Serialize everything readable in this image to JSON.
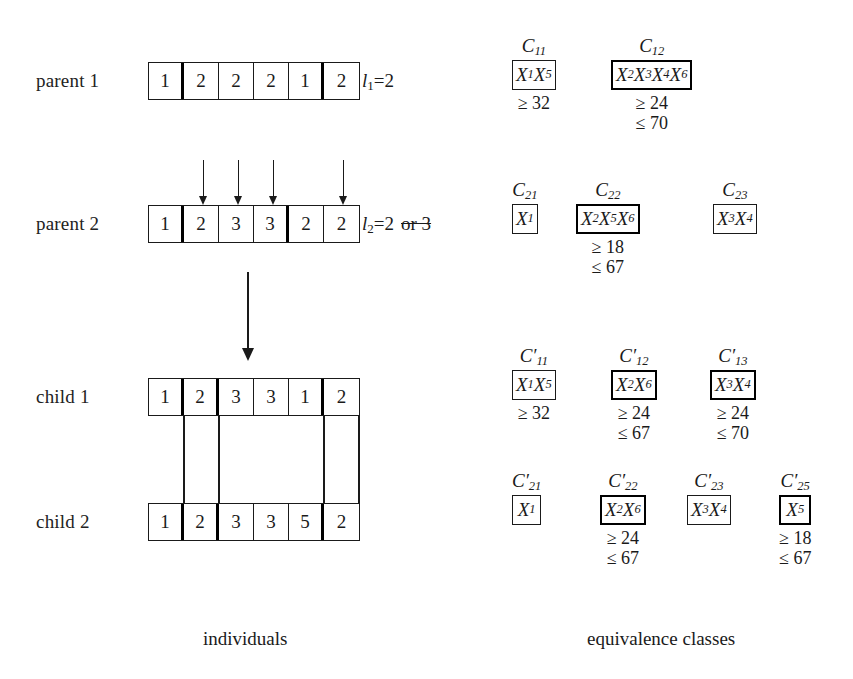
{
  "figure": {
    "captions": {
      "left": "individuals",
      "right": "equivalence classes"
    }
  },
  "individuals": {
    "rows": [
      {
        "label": "parent 1",
        "name": "parent-1",
        "cells": [
          "1",
          "2",
          "2",
          "2",
          "1",
          "2"
        ],
        "l_label": "l",
        "l_sub": "1",
        "l_value": "=2",
        "l_strike": ""
      },
      {
        "label": "parent 2",
        "name": "parent-2",
        "cells": [
          "1",
          "2",
          "3",
          "3",
          "2",
          "2"
        ],
        "l_label": "l",
        "l_sub": "2",
        "l_value": "=2",
        "l_strike": "or 3"
      },
      {
        "label": "child 1",
        "name": "child-1",
        "cells": [
          "1",
          "2",
          "3",
          "3",
          "1",
          "2"
        ],
        "l_label": "",
        "l_sub": "",
        "l_value": "",
        "l_strike": ""
      },
      {
        "label": "child 2",
        "name": "child-2",
        "cells": [
          "1",
          "2",
          "3",
          "3",
          "5",
          "2"
        ],
        "l_label": "",
        "l_sub": "",
        "l_value": "",
        "l_strike": ""
      }
    ]
  },
  "equivalence_classes": {
    "groups": [
      {
        "row": "parent-1",
        "items": [
          {
            "name_base": "C",
            "name_sub": "11",
            "prime": "",
            "members": [
              {
                "x": "X",
                "sub": "1"
              },
              {
                "x": "X",
                "sub": "5"
              }
            ],
            "thick": false,
            "bounds": [
              "≥ 32"
            ]
          },
          {
            "name_base": "C",
            "name_sub": "12",
            "prime": "",
            "members": [
              {
                "x": "X",
                "sub": "2"
              },
              {
                "x": "X",
                "sub": "3"
              },
              {
                "x": "X",
                "sub": "4"
              },
              {
                "x": "X",
                "sub": "6"
              }
            ],
            "thick": true,
            "bounds": [
              "≥ 24",
              "≤ 70"
            ]
          }
        ]
      },
      {
        "row": "parent-2",
        "items": [
          {
            "name_base": "C",
            "name_sub": "21",
            "prime": "",
            "members": [
              {
                "x": "X",
                "sub": "1"
              }
            ],
            "thick": false,
            "bounds": []
          },
          {
            "name_base": "C",
            "name_sub": "22",
            "prime": "",
            "members": [
              {
                "x": "X",
                "sub": "2"
              },
              {
                "x": "X",
                "sub": "5"
              },
              {
                "x": "X",
                "sub": "6"
              }
            ],
            "thick": true,
            "bounds": [
              "≥ 18",
              "≤ 67"
            ]
          },
          {
            "name_base": "C",
            "name_sub": "23",
            "prime": "",
            "members": [
              {
                "x": "X",
                "sub": "3"
              },
              {
                "x": "X",
                "sub": "4"
              }
            ],
            "thick": false,
            "bounds": []
          }
        ]
      },
      {
        "row": "child-1",
        "items": [
          {
            "name_base": "C",
            "name_sub": "11",
            "prime": "′",
            "members": [
              {
                "x": "X",
                "sub": "1"
              },
              {
                "x": "X",
                "sub": "5"
              }
            ],
            "thick": false,
            "bounds": [
              "≥ 32"
            ]
          },
          {
            "name_base": "C",
            "name_sub": "12",
            "prime": "′",
            "members": [
              {
                "x": "X",
                "sub": "2"
              },
              {
                "x": "X",
                "sub": "6"
              }
            ],
            "thick": true,
            "bounds": [
              "≥ 24",
              "≤ 67"
            ]
          },
          {
            "name_base": "C",
            "name_sub": "13",
            "prime": "′",
            "members": [
              {
                "x": "X",
                "sub": "3"
              },
              {
                "x": "X",
                "sub": "4"
              }
            ],
            "thick": true,
            "bounds": [
              "≥ 24",
              "≤ 70"
            ]
          }
        ]
      },
      {
        "row": "child-2",
        "items": [
          {
            "name_base": "C",
            "name_sub": "21",
            "prime": "′",
            "members": [
              {
                "x": "X",
                "sub": "1"
              }
            ],
            "thick": false,
            "bounds": []
          },
          {
            "name_base": "C",
            "name_sub": "22",
            "prime": "′",
            "members": [
              {
                "x": "X",
                "sub": "2"
              },
              {
                "x": "X",
                "sub": "6"
              }
            ],
            "thick": true,
            "bounds": [
              "≥ 24",
              "≤ 67"
            ]
          },
          {
            "name_base": "C",
            "name_sub": "23",
            "prime": "′",
            "members": [
              {
                "x": "X",
                "sub": "3"
              },
              {
                "x": "X",
                "sub": "4"
              }
            ],
            "thick": false,
            "bounds": []
          },
          {
            "name_base": "C",
            "name_sub": "25",
            "prime": "′",
            "members": [
              {
                "x": "X",
                "sub": "5"
              }
            ],
            "thick": true,
            "bounds": [
              "≥ 18",
              "≤ 67"
            ]
          }
        ]
      }
    ]
  }
}
